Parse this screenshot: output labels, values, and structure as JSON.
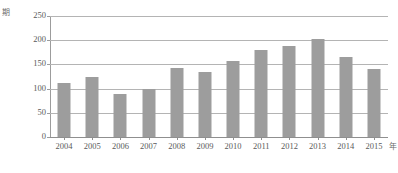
{
  "chart_data": {
    "type": "bar",
    "title": "",
    "xlabel": "年",
    "ylabel": "期",
    "categories": [
      "2004",
      "2005",
      "2006",
      "2007",
      "2008",
      "2009",
      "2010",
      "2011",
      "2012",
      "2013",
      "2014",
      "2015"
    ],
    "values": [
      112,
      125,
      89,
      99,
      143,
      134,
      157,
      180,
      188,
      202,
      165,
      141
    ],
    "series": [
      {
        "name": "期",
        "values": [
          112,
          125,
          89,
          99,
          143,
          134,
          157,
          180,
          188,
          202,
          165,
          141
        ]
      }
    ],
    "ylim": [
      0,
      250
    ],
    "yticks": [
      0,
      50,
      100,
      150,
      200,
      250
    ],
    "ytick_labels": [
      "0",
      "50",
      "100",
      "150",
      "200",
      "250"
    ],
    "grid": "horizontal",
    "legend": "none",
    "bar_color": "#9d9d9d",
    "gridline_color": "#b4b4b4",
    "axis_color": "#9c9c9c",
    "text_color": "#5a5a5a",
    "background": "#ffffff"
  }
}
